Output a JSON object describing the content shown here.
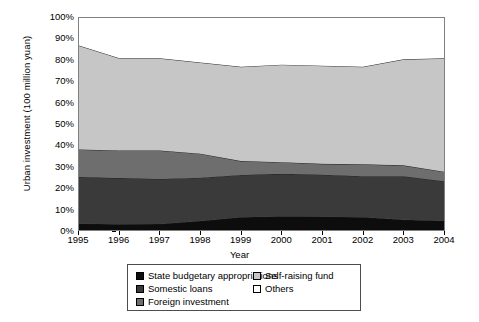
{
  "chart_data": {
    "type": "area",
    "stacked": true,
    "percent_stacked": true,
    "title": "",
    "xlabel": "Year",
    "ylabel": "Urban investment (100 million yuan)",
    "x": [
      1995,
      1996,
      1997,
      1998,
      1999,
      2000,
      2001,
      2002,
      2003,
      2004
    ],
    "xtick_labels": [
      "1995",
      "1996",
      "1997",
      "1998",
      "1999",
      "2000",
      "2001",
      "2002",
      "2003",
      "2004"
    ],
    "ytick_labels": [
      "0%",
      "10%",
      "20%",
      "30%",
      "40%",
      "50%",
      "60%",
      "70%",
      "80%",
      "90%",
      "100%"
    ],
    "ylim": [
      0,
      100
    ],
    "ytick_step": 10,
    "grid": false,
    "legend_position": "bottom",
    "series": [
      {
        "name": "State budgetary appropriations",
        "color": "#0d0d0d",
        "values": [
          3.0,
          2.7,
          2.8,
          4.2,
          6.0,
          6.4,
          6.3,
          6.0,
          4.8,
          4.3
        ]
      },
      {
        "name": "Somestic loans",
        "color": "#3a3a3a",
        "values": [
          22.0,
          21.8,
          21.3,
          20.5,
          20.0,
          20.1,
          19.8,
          19.4,
          20.6,
          18.7
        ]
      },
      {
        "name": "Foreign investment",
        "color": "#6e6e6e",
        "values": [
          13.0,
          13.0,
          13.4,
          11.3,
          6.5,
          5.5,
          5.1,
          5.6,
          5.1,
          4.5
        ]
      },
      {
        "name": "Self-raising fund",
        "color": "#c6c6c6",
        "values": [
          49.0,
          43.5,
          43.5,
          43.0,
          44.5,
          46.0,
          46.3,
          46.0,
          50.0,
          53.5
        ]
      },
      {
        "name": "Others",
        "color": "#ffffff",
        "values": [
          13.0,
          19.0,
          19.0,
          21.0,
          23.0,
          22.0,
          22.5,
          23.0,
          19.5,
          19.0
        ]
      }
    ],
    "cumulative_tops": {
      "state_budgetary_appropriations": [
        3.0,
        2.7,
        2.8,
        4.2,
        6.0,
        6.4,
        6.3,
        6.0,
        4.8,
        4.3
      ],
      "somestic_loans": [
        25.0,
        24.5,
        24.1,
        24.7,
        26.0,
        26.5,
        26.1,
        25.4,
        25.4,
        23.0
      ],
      "foreign_investment": [
        38.0,
        37.5,
        37.5,
        36.0,
        32.5,
        32.0,
        31.2,
        31.0,
        30.5,
        27.5
      ],
      "self_raising_fund": [
        87.0,
        81.0,
        81.0,
        79.0,
        77.0,
        78.0,
        77.5,
        77.0,
        80.5,
        81.0
      ],
      "others": [
        100,
        100,
        100,
        100,
        100,
        100,
        100,
        100,
        100,
        100
      ]
    }
  },
  "legend": {
    "items": [
      {
        "label": "State budgetary appropriations",
        "color": "#0d0d0d"
      },
      {
        "label": "Somestic loans",
        "color": "#3a3a3a"
      },
      {
        "label": "Foreign investment",
        "color": "#6e6e6e"
      },
      {
        "label": "Self-raising fund",
        "color": "#c6c6c6"
      },
      {
        "label": "Others",
        "color": "#ffffff"
      }
    ]
  }
}
